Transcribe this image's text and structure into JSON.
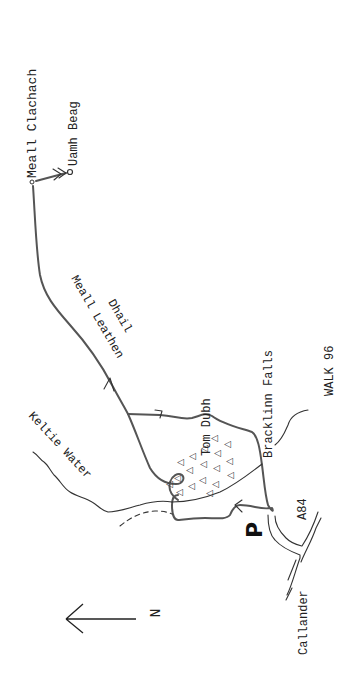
{
  "map": {
    "title": "WALK 96",
    "labels": {
      "meall_clachach": "Meall Clachach",
      "uamh_beag": "Uamh Beag",
      "meall_leathen": "Meall Leathen",
      "dhail": "Dhail",
      "tom_dubh": "Tom Dubh",
      "bracklinn_falls": "Bracklinn Falls",
      "keltie_water": "Keltie Water",
      "a84": "A84",
      "callander": "Callander",
      "parking": "P",
      "north": "N"
    },
    "colors": {
      "route": "#555555",
      "ink": "#222222",
      "background": "#ffffff"
    },
    "icons": {
      "north_arrow": "north-arrow-icon",
      "parking": "parking-icon",
      "summit": "summit-marker-icon",
      "cave": "cave-marker-icon",
      "forest": "conifer-tree-icon",
      "direction": "direction-arrow-icon"
    }
  }
}
